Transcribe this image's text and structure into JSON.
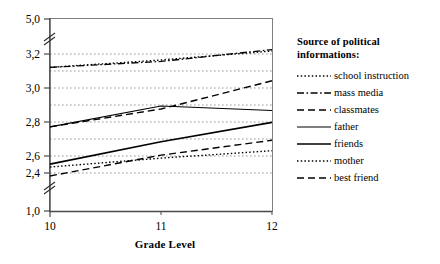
{
  "chart_data": {
    "type": "line",
    "title": "",
    "xlabel": "Grade Level",
    "ylabel": "",
    "x": [
      10,
      11,
      12
    ],
    "categories": [
      "10",
      "11",
      "12"
    ],
    "xtick_labels": [
      "10",
      "11",
      "12"
    ],
    "ytick_labels": [
      "5,0",
      "3,2",
      "3,0",
      "2,8",
      "2,6",
      "2,4",
      "1,0"
    ],
    "ytick_values": [
      5.0,
      3.2,
      3.0,
      2.8,
      2.6,
      2.4,
      1.0
    ],
    "ylim": [
      1.0,
      5.0
    ],
    "xlim": [
      10,
      12
    ],
    "grid": true,
    "axis_breaks": [
      "between 5,0 and 3,2",
      "between 2,4 and 1,0"
    ],
    "legend_position": "right",
    "legend_title": "Source of political informations:",
    "series": [
      {
        "name": "school instruction",
        "style": "dotted",
        "values": [
          3.11,
          3.16,
          3.22
        ]
      },
      {
        "name": "mass media",
        "style": "dashdot",
        "values": [
          3.11,
          3.15,
          3.23
        ]
      },
      {
        "name": "classmates",
        "style": "dashed",
        "values": [
          2.71,
          2.83,
          3.02
        ]
      },
      {
        "name": "father",
        "style": "solid-thin",
        "values": [
          2.71,
          2.85,
          2.82
        ]
      },
      {
        "name": "friends",
        "style": "solid-thick",
        "values": [
          2.46,
          2.61,
          2.74
        ]
      },
      {
        "name": "mother",
        "style": "dotted",
        "values": [
          2.44,
          2.5,
          2.55
        ]
      },
      {
        "name": "best friend",
        "style": "dashed",
        "values": [
          2.38,
          2.52,
          2.62
        ]
      }
    ]
  },
  "axis": {
    "x_title": "Grade Level",
    "y_ticks": [
      {
        "label": "5,0"
      },
      {
        "label": "3,2"
      },
      {
        "label": "3,0"
      },
      {
        "label": "2,8"
      },
      {
        "label": "2,6"
      },
      {
        "label": "2,4"
      },
      {
        "label": "1,0"
      }
    ],
    "x_ticks": [
      {
        "label": "10"
      },
      {
        "label": "11"
      },
      {
        "label": "12"
      }
    ]
  },
  "legend": {
    "title_line1": "Source of political",
    "title_line2": "informations:",
    "items": [
      {
        "label": "school instruction",
        "icon": "dotted-line-icon"
      },
      {
        "label": "mass media",
        "icon": "dash-dot-line-icon"
      },
      {
        "label": "classmates",
        "icon": "dashed-line-icon"
      },
      {
        "label": "father",
        "icon": "thin-solid-line-icon"
      },
      {
        "label": "friends",
        "icon": "thick-solid-line-icon"
      },
      {
        "label": "mother",
        "icon": "dotted-line-icon"
      },
      {
        "label": "best friend",
        "icon": "dashed-line-icon"
      }
    ]
  },
  "colors": {
    "line": "#000000",
    "grid": "#8a8a8a",
    "frame": "#808080",
    "background": "#ffffff"
  }
}
